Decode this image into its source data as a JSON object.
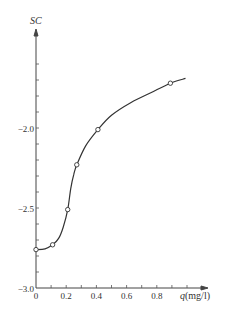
{
  "chart_data": {
    "type": "line",
    "title": "",
    "xlabel_symbol": "q",
    "xlabel_unit": "(mg/l)",
    "xlabel": "q(mg/l)",
    "ylabel": "SC",
    "x_ticks": [
      0,
      0.1,
      0.2,
      0.3,
      0.4,
      0.5,
      0.6,
      0.7,
      0.8,
      0.9,
      1.0
    ],
    "x_tick_labels": [
      "0",
      "0.2",
      "0.4",
      "0.6",
      "0.8"
    ],
    "y_ticks": [
      -3.0,
      -2.9,
      -2.8,
      -2.7,
      -2.6,
      -2.5,
      -2.4,
      -2.3,
      -2.2,
      -2.1,
      -2.0,
      -1.9,
      -1.8,
      -1.7,
      -1.6
    ],
    "y_tick_labels": [
      "-3.0",
      "-2.5",
      "-2.0"
    ],
    "xlim": [
      0,
      1.0
    ],
    "ylim": [
      -3.0,
      -1.4
    ],
    "grid": false,
    "legend": null,
    "series": [
      {
        "name": "SC vs q",
        "markers": "open-circle",
        "points": [
          {
            "x": 0.0,
            "y": -2.76
          },
          {
            "x": 0.11,
            "y": -2.73
          },
          {
            "x": 0.21,
            "y": -2.51
          },
          {
            "x": 0.27,
            "y": -2.23
          },
          {
            "x": 0.41,
            "y": -2.01
          },
          {
            "x": 0.89,
            "y": -1.72
          }
        ],
        "curve": [
          {
            "x": 0.0,
            "y": -2.76
          },
          {
            "x": 0.06,
            "y": -2.755
          },
          {
            "x": 0.11,
            "y": -2.73
          },
          {
            "x": 0.15,
            "y": -2.69
          },
          {
            "x": 0.18,
            "y": -2.62
          },
          {
            "x": 0.21,
            "y": -2.51
          },
          {
            "x": 0.23,
            "y": -2.38
          },
          {
            "x": 0.25,
            "y": -2.29
          },
          {
            "x": 0.27,
            "y": -2.23
          },
          {
            "x": 0.33,
            "y": -2.11
          },
          {
            "x": 0.41,
            "y": -2.01
          },
          {
            "x": 0.5,
            "y": -1.92
          },
          {
            "x": 0.63,
            "y": -1.84
          },
          {
            "x": 0.76,
            "y": -1.78
          },
          {
            "x": 0.89,
            "y": -1.72
          },
          {
            "x": 0.99,
            "y": -1.69
          }
        ]
      }
    ]
  }
}
